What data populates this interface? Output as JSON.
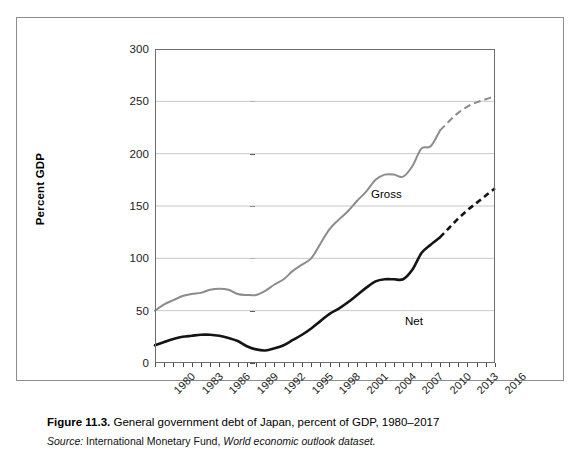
{
  "figure": {
    "caption_number": "Figure 11.3.",
    "caption_text": "General government debt of Japan, percent of GDP, 1980–2017",
    "source_lead": "Source:",
    "source_org": "International Monetary Fund,",
    "source_dataset": "World economic outlook dataset."
  },
  "chart_data": {
    "type": "line",
    "title": "General government debt of Japan, percent of GDP, 1980–2017",
    "xlabel": "",
    "ylabel": "Percent GDP",
    "ylim": [
      0,
      300
    ],
    "yticks": [
      0,
      50,
      100,
      150,
      200,
      250,
      300
    ],
    "xlim": [
      1980,
      2017
    ],
    "xticks": [
      1980,
      1983,
      1986,
      1989,
      1992,
      1995,
      1998,
      2001,
      2004,
      2007,
      2010,
      2013,
      2016
    ],
    "x_minor_tick_step": 1,
    "grid": "horizontal",
    "legend": "inline-labels",
    "x": [
      1980,
      1981,
      1982,
      1983,
      1984,
      1985,
      1986,
      1987,
      1988,
      1989,
      1990,
      1991,
      1992,
      1993,
      1994,
      1995,
      1996,
      1997,
      1998,
      1999,
      2000,
      2001,
      2002,
      2003,
      2004,
      2005,
      2006,
      2007,
      2008,
      2009,
      2010,
      2011,
      2012,
      2013,
      2014,
      2015,
      2016,
      2017
    ],
    "series": [
      {
        "name": "Gross",
        "color": "#8c8c8c",
        "solid_through": 2011,
        "dashed_from": 2011,
        "values": [
          50,
          56,
          60,
          64,
          66,
          67,
          70,
          71,
          70,
          66,
          65,
          65,
          69,
          75,
          80,
          88,
          94,
          100,
          114,
          128,
          137,
          145,
          155,
          164,
          175,
          180,
          180,
          178,
          188,
          205,
          207,
          222,
          231,
          239,
          245,
          249,
          252,
          255
        ]
      },
      {
        "name": "Net",
        "color": "#141414",
        "solid_through": 2011,
        "dashed_from": 2011,
        "values": [
          17,
          20,
          23,
          25,
          26,
          27,
          27,
          26,
          24,
          21,
          16,
          13,
          12,
          14,
          17,
          22,
          27,
          33,
          40,
          47,
          52,
          58,
          65,
          72,
          78,
          80,
          80,
          80,
          89,
          105,
          113,
          120,
          129,
          138,
          146,
          153,
          160,
          167
        ]
      }
    ],
    "annotations": [
      {
        "text": "Gross",
        "x": 2000,
        "y": 170
      },
      {
        "text": "Net",
        "x": 2008,
        "y": 73
      }
    ]
  },
  "axis": {
    "y_title": "Percent GDP",
    "y_tick_labels": [
      "300",
      "250",
      "200",
      "150",
      "100",
      "50",
      "0"
    ],
    "x_tick_labels": [
      "1980",
      "1983",
      "1986",
      "1989",
      "1992",
      "1995",
      "1998",
      "2001",
      "2004",
      "2007",
      "2010",
      "2013",
      "2016"
    ]
  },
  "colors": {
    "gross_line": "#8c8c8c",
    "net_line": "#141414",
    "gridline": "#c8c8c8",
    "plot_border": "#6d6d6d",
    "figure_border": "#8d8d8d"
  }
}
